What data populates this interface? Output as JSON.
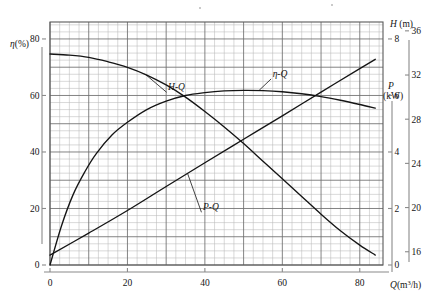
{
  "chart_data": {
    "type": "line",
    "title": "",
    "xlabel": "Q (m³/h)",
    "xlim": [
      0,
      86
    ],
    "xticks": [
      0,
      20,
      40,
      60,
      80
    ],
    "xticklabels": [
      "0",
      "20",
      "40",
      "60",
      "80"
    ],
    "grid": true,
    "grid_minor": true,
    "legend": "inline-annotations",
    "axes": [
      {
        "id": "eta",
        "name": "eta-axis",
        "side": "left",
        "label": "η(%)",
        "label_symbol": "η",
        "label_unit": "(%)",
        "lim": [
          0,
          86
        ],
        "ticks": [
          0,
          20,
          40,
          60,
          80
        ],
        "ticklabels": [
          "0",
          "20",
          "40",
          "60",
          "80"
        ]
      },
      {
        "id": "P",
        "name": "power-axis",
        "side": "right-inner",
        "label": "P (kW)",
        "label_symbol": "P",
        "label_unit": "(kW)",
        "lim": [
          0,
          8.6
        ],
        "ticks": [
          0,
          2,
          4,
          6,
          8
        ],
        "ticklabels": [
          "0",
          "2",
          "4",
          "6",
          "8"
        ]
      },
      {
        "id": "H",
        "name": "head-axis",
        "side": "right-outer",
        "label": "H (m)",
        "label_symbol": "H",
        "label_unit": "(m)",
        "lim": [
          14.8,
          36.8
        ],
        "ticks": [
          16,
          20,
          24,
          28,
          32,
          36
        ],
        "ticklabels": [
          "16",
          "20",
          "24",
          "28",
          "32",
          "36"
        ]
      }
    ],
    "series": [
      {
        "name": "H-Q",
        "label": "H-Q",
        "axis": "H",
        "description": "Pump head versus flow rate, falling characteristic curve",
        "points": [
          [
            0,
            33.9
          ],
          [
            5,
            33.8
          ],
          [
            10,
            33.6
          ],
          [
            15,
            33.2
          ],
          [
            20,
            32.7
          ],
          [
            25,
            32.0
          ],
          [
            30,
            31.1
          ],
          [
            35,
            30.0
          ],
          [
            40,
            28.7
          ],
          [
            45,
            27.3
          ],
          [
            50,
            25.8
          ],
          [
            55,
            24.2
          ],
          [
            60,
            22.6
          ],
          [
            65,
            21.0
          ],
          [
            70,
            19.4
          ],
          [
            75,
            17.9
          ],
          [
            80,
            16.6
          ],
          [
            84,
            15.7
          ]
        ],
        "label_pos": [
          30.5,
          30.6
        ],
        "leader_to": [
          24.5,
          32.1
        ]
      },
      {
        "name": "eta-Q",
        "label": "η-Q",
        "axis": "eta",
        "description": "Pump efficiency versus flow rate, peaked characteristic curve",
        "points": [
          [
            0,
            0
          ],
          [
            3,
            14
          ],
          [
            6,
            25
          ],
          [
            9,
            33
          ],
          [
            12,
            39.5
          ],
          [
            16,
            46
          ],
          [
            20,
            50.5
          ],
          [
            25,
            55
          ],
          [
            30,
            58
          ],
          [
            35,
            60
          ],
          [
            40,
            61
          ],
          [
            45,
            61.6
          ],
          [
            50,
            61.8
          ],
          [
            55,
            61.7
          ],
          [
            60,
            61.3
          ],
          [
            65,
            60.6
          ],
          [
            70,
            59.6
          ],
          [
            75,
            58.3
          ],
          [
            80,
            56.8
          ],
          [
            84,
            55.5
          ]
        ],
        "label_pos": [
          57.5,
          66.5
        ],
        "leader_to": [
          54,
          61.8
        ]
      },
      {
        "name": "P-Q",
        "label": "P-Q",
        "axis": "P",
        "description": "Shaft power versus flow rate, rising near-linear curve",
        "points": [
          [
            0,
            0.35
          ],
          [
            10,
            1.13
          ],
          [
            20,
            1.93
          ],
          [
            30,
            2.78
          ],
          [
            40,
            3.62
          ],
          [
            50,
            4.45
          ],
          [
            60,
            5.28
          ],
          [
            70,
            6.12
          ],
          [
            80,
            6.95
          ],
          [
            84,
            7.28
          ]
        ],
        "label_pos": [
          39.5,
          1.93
        ],
        "leader_to": [
          35.5,
          3.25
        ]
      }
    ]
  },
  "colors": {
    "curve": "#151515",
    "grid_major": "#6b6b6b",
    "grid_minor": "#b4b4b4",
    "axis": "#7a7a7a",
    "text": "#141414",
    "background": "#ffffff"
  }
}
